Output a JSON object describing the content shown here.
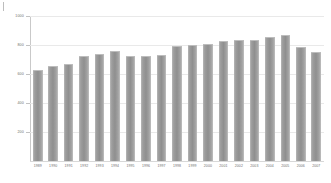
{
  "chart_data": {
    "type": "bar",
    "title": "",
    "subtitle": "",
    "xlabel": "",
    "ylabel": "",
    "grid": true,
    "legend": null,
    "legend_position": "none",
    "ylim": [
      0,
      1000
    ],
    "yticks": [
      1000,
      800,
      600,
      400,
      200
    ],
    "ytick_labels": [
      "1000",
      "800",
      "600",
      "400",
      "200"
    ],
    "bar_color": "#9a9a9a",
    "grid_color": "#e9e9e9",
    "axis_color": "#c9c9c9",
    "label_color": "#6d6d6d",
    "categories": [
      "1989",
      "1990",
      "1991",
      "1992",
      "1993",
      "1994",
      "1995",
      "1996",
      "1997",
      "1998",
      "1999",
      "2000",
      "2001",
      "2002",
      "2003",
      "2004",
      "2005",
      "2006",
      "2007"
    ],
    "values": [
      620,
      645,
      665,
      720,
      730,
      750,
      715,
      715,
      725,
      785,
      790,
      800,
      820,
      828,
      830,
      845,
      862,
      780,
      745
    ]
  }
}
